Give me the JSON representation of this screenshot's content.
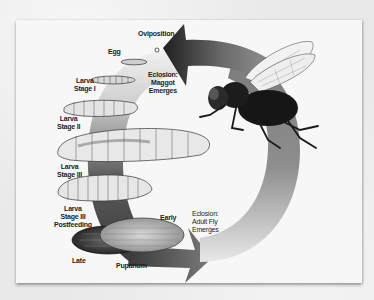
{
  "diagram": {
    "labels": {
      "oviposition": "Oviposition",
      "egg": "Egg",
      "eclosion_maggot": [
        "Eclosion:",
        "Maggot",
        "Emerges"
      ],
      "larva_stage_1": [
        "Larva",
        "Stage I"
      ],
      "larva_stage_2": [
        "Larva",
        "Stage II"
      ],
      "larva_stage_3": [
        "Larva",
        "Stage III"
      ],
      "larva_stage_3_postfeeding": [
        "Larva",
        "Stage III",
        "Postfeeding"
      ],
      "early": "Early",
      "late": "Late",
      "puparium": "Puparium",
      "eclosion_adult": [
        "Eclosion:",
        "Adult Fly",
        "Emerges"
      ]
    },
    "stages": [
      "Oviposition",
      "Egg",
      "Eclosion: Maggot Emerges",
      "Larva Stage I",
      "Larva Stage II",
      "Larva Stage III",
      "Larva Stage III Postfeeding",
      "Puparium (Early)",
      "Puparium (Late)",
      "Eclosion: Adult Fly Emerges"
    ],
    "icons": {
      "cycle_arrow": "circular-arrow",
      "adult": "adult-fly",
      "egg": "egg",
      "larvae": "maggot",
      "pupae": "puparium"
    },
    "colors": {
      "background": "#e9e9e9",
      "card": "#f7f7f7",
      "arrow_dark": "#2a2a2a",
      "arrow_light": "#d8d8d8",
      "larva_fill": "#e6e6e6",
      "text": "#1e1e1e"
    }
  }
}
